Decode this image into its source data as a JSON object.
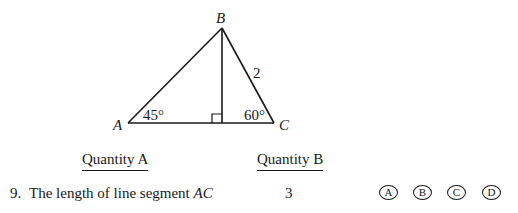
{
  "figure": {
    "vertices": {
      "A": "A",
      "B": "B",
      "C": "C"
    },
    "angle_A": "45°",
    "angle_C": "60°",
    "side_BC": "2",
    "right_angle_marker": "foot of altitude from B"
  },
  "columns": {
    "quantity_a_header": "Quantity A",
    "quantity_b_header": "Quantity B"
  },
  "question": {
    "number": "9.",
    "quantity_a_text": "The length of line segment",
    "quantity_a_var": "AC",
    "quantity_b": "3"
  },
  "choices": [
    {
      "label": "A"
    },
    {
      "label": "B"
    },
    {
      "label": "C"
    },
    {
      "label": "D"
    }
  ]
}
